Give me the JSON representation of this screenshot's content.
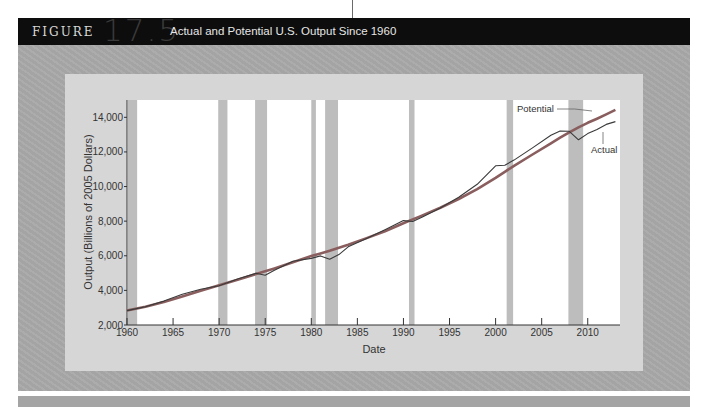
{
  "figure": {
    "label": "FIGURE",
    "number": "17.5",
    "title": "Actual and Potential U.S. Output Since 1960"
  },
  "colors": {
    "header_bg": "#0d0d0d",
    "outer_panel": "#a9a9a9",
    "inner_panel": "#d6d6d6",
    "plot_bg": "#ffffff",
    "recession_bar": "#bdbdbd",
    "potential_line": "#8a5e5e",
    "actual_line": "#3a3a3a"
  },
  "chart_data": {
    "type": "line",
    "title": "Actual and Potential U.S. Output Since 1960",
    "xlabel": "Date",
    "ylabel": "Output (Billions of 2005 Dollars)",
    "xlim": [
      1960,
      2013.5
    ],
    "ylim": [
      2000,
      15000
    ],
    "x_ticks": [
      1960,
      1965,
      1970,
      1975,
      1980,
      1985,
      1990,
      1995,
      2000,
      2005,
      2010
    ],
    "y_ticks": [
      2000,
      4000,
      6000,
      8000,
      10000,
      12000,
      14000
    ],
    "y_tick_labels": [
      "2,000",
      "4,000",
      "6,000",
      "8,000",
      "10,000",
      "12,000",
      "14,000"
    ],
    "grid": false,
    "legend": {
      "position": "inline-annotations",
      "entries": [
        "Potential",
        "Actual"
      ]
    },
    "recessions": [
      [
        1960.1,
        1961.1
      ],
      [
        1969.9,
        1970.9
      ],
      [
        1973.9,
        1975.2
      ],
      [
        1980.0,
        1980.5
      ],
      [
        1981.5,
        1982.9
      ],
      [
        1990.6,
        1991.2
      ],
      [
        2001.2,
        2001.9
      ],
      [
        2007.9,
        2009.5
      ]
    ],
    "x": [
      1960,
      1962,
      1964,
      1966,
      1968,
      1970,
      1972,
      1974,
      1975,
      1976,
      1978,
      1980,
      1981,
      1982,
      1983,
      1984,
      1986,
      1988,
      1990,
      1991,
      1992,
      1994,
      1996,
      1998,
      2000,
      2001,
      2002,
      2004,
      2006,
      2007,
      2008,
      2009,
      2010,
      2011,
      2012,
      2013
    ],
    "series": [
      {
        "name": "Potential",
        "values": [
          2830,
          3050,
          3330,
          3650,
          3980,
          4300,
          4620,
          4940,
          5100,
          5270,
          5620,
          5980,
          6130,
          6290,
          6460,
          6640,
          7020,
          7420,
          7880,
          8100,
          8320,
          8780,
          9280,
          9850,
          10500,
          10850,
          11200,
          11850,
          12500,
          12820,
          13130,
          13420,
          13680,
          13920,
          14170,
          14430
        ]
      },
      {
        "name": "Actual",
        "values": [
          2830,
          3060,
          3380,
          3780,
          4060,
          4270,
          4660,
          4990,
          4880,
          5160,
          5680,
          5850,
          5990,
          5800,
          6070,
          6520,
          7000,
          7500,
          8030,
          7980,
          8220,
          8760,
          9380,
          10130,
          11200,
          11230,
          11530,
          12230,
          12960,
          13210,
          13190,
          12700,
          13060,
          13300,
          13590,
          13750
        ]
      }
    ]
  },
  "annotations": {
    "potential_label": "Potential",
    "actual_label": "Actual"
  }
}
